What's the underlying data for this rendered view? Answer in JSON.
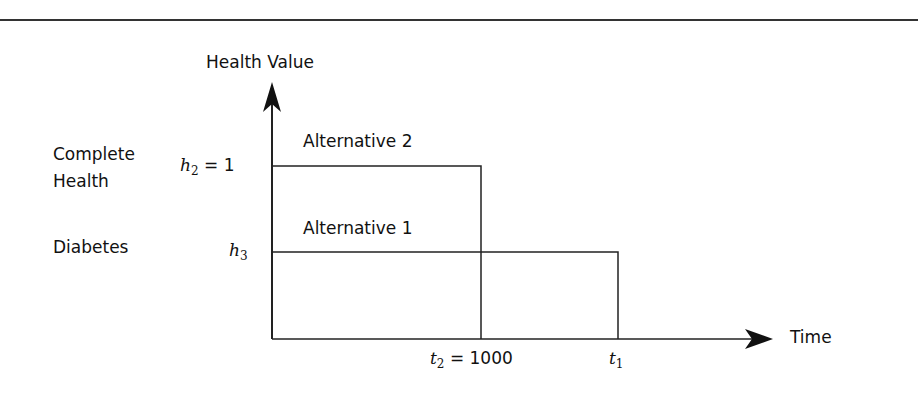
{
  "diagram": {
    "y_axis_label": "Health Value",
    "x_axis_label": "Time",
    "states": [
      {
        "label_line1": "Complete",
        "label_line2": "Health",
        "symbol_base": "h",
        "symbol_sub": "2",
        "symbol_value": "= 1"
      },
      {
        "label_line1": "Diabetes",
        "symbol_base": "h",
        "symbol_sub": "3"
      }
    ],
    "alternatives": [
      {
        "label": "Alternative 2",
        "health": "h2 = 1",
        "duration": "t2 = 1000"
      },
      {
        "label": "Alternative 1",
        "health": "h3",
        "duration": "t1"
      }
    ],
    "x_ticks": [
      {
        "symbol_base": "t",
        "symbol_sub": "2",
        "symbol_value": "= 1000"
      },
      {
        "symbol_base": "t",
        "symbol_sub": "1"
      }
    ],
    "colors": {
      "line": "#222222",
      "background": "#ffffff"
    }
  }
}
